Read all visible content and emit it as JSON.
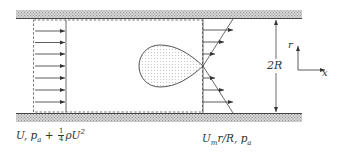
{
  "diagram": {
    "type": "pipe-flow-schematic",
    "walls": {
      "top": "upper pipe wall",
      "bottom": "lower pipe wall",
      "fill": "hatched gray"
    },
    "inlet": {
      "profile": "uniform",
      "arrow_count": 8,
      "label_main": "U, p",
      "label_sub": "a",
      "label_plus": " + ",
      "frac_num": "1",
      "frac_den": "4",
      "label_rho": "ρU",
      "label_sup": "2"
    },
    "body": {
      "shape": "teardrop",
      "fill": "dotted",
      "description": "recirculation bubble"
    },
    "outlet": {
      "profile": "linear",
      "arrow_count": 6,
      "label_main": "U",
      "label_sub_m": "m",
      "label_rest": "r/R, p",
      "label_sub_a": "a"
    },
    "dimension": {
      "label": "2R"
    },
    "axes": {
      "vertical": "r",
      "horizontal": "x"
    }
  },
  "colors": {
    "line": "#3a3a3a",
    "hatch": "#9a9a9a",
    "hatch_bg": "#d4d4d4",
    "dots": "#9a9a9a"
  }
}
